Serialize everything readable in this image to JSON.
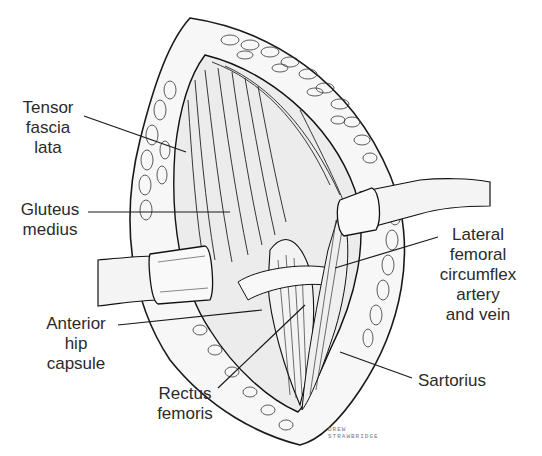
{
  "figure": {
    "labels": [
      {
        "id": "tensor-fascia-lata",
        "lines": [
          "Tensor",
          "fascia",
          "lata"
        ]
      },
      {
        "id": "gluteus-medius",
        "lines": [
          "Gluteus",
          "medius"
        ]
      },
      {
        "id": "anterior-hip-capsule",
        "lines": [
          "Anterior",
          "hip",
          "capsule"
        ]
      },
      {
        "id": "rectus-femoris",
        "lines": [
          "Rectus",
          "femoris"
        ]
      },
      {
        "id": "lateral-femoral-circumflex",
        "lines": [
          "Lateral",
          "femoral",
          "circumflex",
          "artery",
          "and vein"
        ]
      },
      {
        "id": "sartorius",
        "lines": [
          "Sartorius"
        ]
      }
    ],
    "signature": [
      "DREW",
      "STRAWBRIDGE"
    ],
    "colors": {
      "ink": "#1a1a1a",
      "background": "#ffffff",
      "retractor": "#f2f2f2",
      "muscle": "#e9e9e9",
      "fat": "#f7f7f7"
    }
  }
}
